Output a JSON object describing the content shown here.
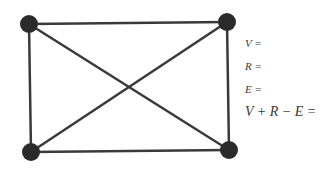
{
  "graph": {
    "vertices": [
      {
        "id": "top-left",
        "x": 29,
        "y": 24
      },
      {
        "id": "top-right",
        "x": 227,
        "y": 22
      },
      {
        "id": "bottom-left",
        "x": 31,
        "y": 152
      },
      {
        "id": "bottom-right",
        "x": 229,
        "y": 150
      }
    ],
    "edges": [
      [
        "top-left",
        "top-right"
      ],
      [
        "top-left",
        "bottom-left"
      ],
      [
        "top-right",
        "bottom-right"
      ],
      [
        "bottom-left",
        "bottom-right"
      ],
      [
        "top-left",
        "bottom-right"
      ],
      [
        "top-right",
        "bottom-left"
      ]
    ],
    "node_color": "#2a2a2a",
    "edge_color": "#3a3a3a"
  },
  "labels": {
    "v": "V =",
    "r": "R =",
    "e": "E =",
    "formula": "V + R − E ="
  }
}
